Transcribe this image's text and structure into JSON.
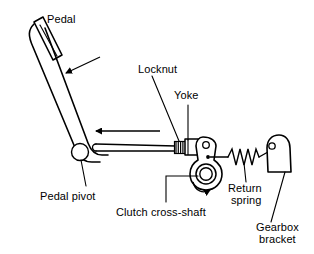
{
  "diagram": {
    "background_color": "#ffffff",
    "line_color": "#000000",
    "labels": {
      "pedal": "Pedal",
      "locknut": "Locknut",
      "yoke": "Yoke",
      "pedal_pivot": "Pedal pivot",
      "clutch_cross_shaft": "Clutch cross-shaft",
      "return_spring_line1": "Return",
      "return_spring_line2": "spring",
      "gearbox_bracket_line1": "Gearbox",
      "gearbox_bracket_line2": "bracket"
    },
    "parts": [
      {
        "name": "pedal-pad",
        "label": "Pedal"
      },
      {
        "name": "pedal-arm",
        "label": "Pedal"
      },
      {
        "name": "pedal-pivot-bore",
        "label": "Pedal pivot"
      },
      {
        "name": "push-rod",
        "label": "Push rod"
      },
      {
        "name": "locknut",
        "label": "Locknut"
      },
      {
        "name": "yoke",
        "label": "Yoke"
      },
      {
        "name": "cross-shaft-lever",
        "label": "Clutch cross-shaft"
      },
      {
        "name": "return-spring",
        "label": "Return spring"
      },
      {
        "name": "gearbox-bracket",
        "label": "Gearbox bracket"
      }
    ],
    "arrows": [
      {
        "name": "pedal-travel-arrow",
        "direction": "down-left"
      },
      {
        "name": "rod-travel-arrow",
        "direction": "left"
      },
      {
        "name": "shaft-rotation-arrow",
        "direction": "clockwise"
      }
    ]
  }
}
